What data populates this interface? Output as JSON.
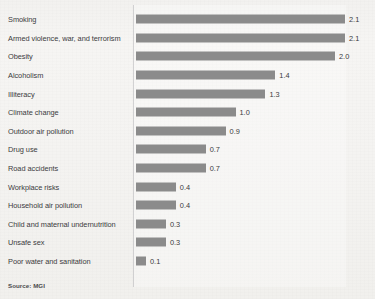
{
  "source_note": "Source: MGI",
  "chart_data": {
    "type": "bar",
    "orientation": "horizontal",
    "title": "",
    "xlabel": "",
    "ylabel": "",
    "grid": false,
    "legend": null,
    "xlim": [
      0,
      2.1
    ],
    "value_format": "one-decimal",
    "bar_color": "#8b8b8b",
    "label_color": "#3b3b3d",
    "categories": [
      "Smoking",
      "Armed violence, war, and terrorism",
      "Obesity",
      "Alcoholism",
      "Illiteracy",
      "Climate change",
      "Outdoor air pollution",
      "Drug use",
      "Road accidents",
      "Workplace risks",
      "Household air pollution",
      "Child and maternal undernutrition",
      "Unsafe sex",
      "Poor water and sanitation"
    ],
    "values": [
      2.1,
      2.1,
      2.0,
      1.4,
      1.3,
      1.0,
      0.9,
      0.7,
      0.7,
      0.4,
      0.4,
      0.3,
      0.3,
      0.1
    ],
    "value_labels": [
      "2.1",
      "2.1",
      "2.0",
      "1.4",
      "1.3",
      "1.0",
      "0.9",
      "0.7",
      "0.7",
      "0.4",
      "0.4",
      "0.3",
      "0.3",
      "0.1"
    ]
  }
}
